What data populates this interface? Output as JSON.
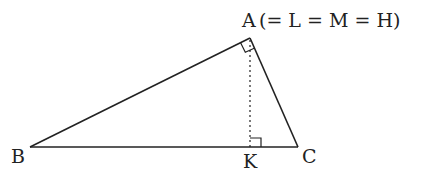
{
  "diagram": {
    "type": "geometry-right-triangle",
    "labels": {
      "A": "A",
      "A_note": "(= L = M = H)",
      "B": "B",
      "C": "C",
      "K": "K"
    },
    "points": {
      "A": [
        250,
        38
      ],
      "B": [
        30,
        147
      ],
      "C": [
        298,
        147
      ],
      "K": [
        250,
        147
      ]
    },
    "segments": [
      "AB",
      "AC",
      "BC"
    ],
    "dashed_segments": [
      "AK"
    ],
    "right_angles": [
      "A",
      "K"
    ],
    "colors": {
      "stroke": "#222222",
      "background": "#ffffff"
    }
  }
}
